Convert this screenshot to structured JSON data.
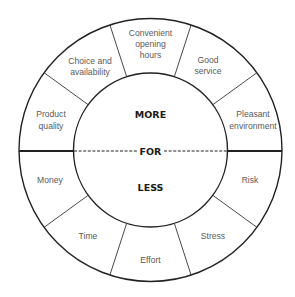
{
  "diagram": {
    "center": {
      "top_label": "MORE",
      "middle_label": "FOR",
      "bottom_label": "LESS"
    },
    "more_segments": [
      {
        "lines": [
          "Product",
          "quality"
        ]
      },
      {
        "lines": [
          "Choice and",
          "availability"
        ]
      },
      {
        "lines": [
          "Convenient",
          "opening",
          "hours"
        ]
      },
      {
        "lines": [
          "Good",
          "service"
        ]
      },
      {
        "lines": [
          "Pleasant",
          "environment"
        ]
      }
    ],
    "less_segments": [
      {
        "lines": [
          "Money"
        ]
      },
      {
        "lines": [
          "Time"
        ]
      },
      {
        "lines": [
          "Effort"
        ]
      },
      {
        "lines": [
          "Stress"
        ]
      },
      {
        "lines": [
          "Risk"
        ]
      }
    ],
    "colors": {
      "line": "#222222",
      "label_text": "#5a5a5a",
      "center_text": "#1a1a1a",
      "background": "#ffffff"
    }
  }
}
